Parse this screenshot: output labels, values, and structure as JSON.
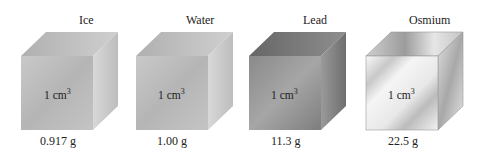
{
  "cubes": [
    {
      "name": "Ice",
      "volume": "1 cm",
      "volume_exp": "3",
      "mass": "0.917 g"
    },
    {
      "name": "Water",
      "volume": "1 cm",
      "volume_exp": "3",
      "mass": "1.00 g"
    },
    {
      "name": "Lead",
      "volume": "1 cm",
      "volume_exp": "3",
      "mass": "11.3 g"
    },
    {
      "name": "Osmium",
      "volume": "1 cm",
      "volume_exp": "3",
      "mass": "22.5 g"
    }
  ]
}
